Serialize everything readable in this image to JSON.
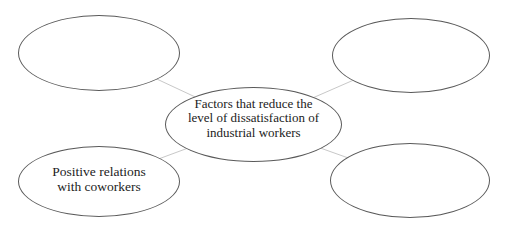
{
  "diagram": {
    "type": "concept-map",
    "colors": {
      "background": "#ffffff",
      "ellipse_stroke": "#5a5a5a",
      "connector": "#c8c8c8",
      "text": "#1c1c1c"
    },
    "center_node": {
      "label": "Factors that reduce the level of dissatisfaction of industrial workers",
      "lines": [
        "Factors that reduce the",
        "level of dissatisfaction of",
        "industrial workers"
      ]
    },
    "outer_nodes": [
      {
        "position": "top-left",
        "label": "",
        "lines": [
          "",
          ""
        ]
      },
      {
        "position": "top-right",
        "label": "",
        "lines": [
          "",
          ""
        ]
      },
      {
        "position": "bottom-left",
        "label": "Positive relations with coworkers",
        "lines": [
          "Positive relations",
          "with coworkers"
        ]
      },
      {
        "position": "bottom-right",
        "label": "",
        "lines": [
          "",
          ""
        ]
      }
    ]
  }
}
